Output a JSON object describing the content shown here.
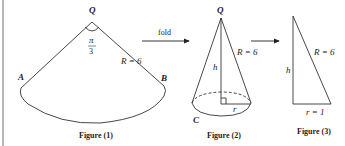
{
  "figures": [
    {
      "caption": "Figure (1)",
      "shape": "sector",
      "labels": {
        "vertex": "Q",
        "angle_num": "π",
        "angle_den": "3",
        "radius": "R = 6",
        "left_point": "A",
        "right_point": "B"
      }
    },
    {
      "caption": "Figure (2)",
      "shape": "cone",
      "labels": {
        "apex": "Q",
        "height": "h",
        "slant": "R = 6",
        "base_radius": "r",
        "base_point": "C"
      }
    },
    {
      "caption": "Figure (3)",
      "shape": "right-triangle",
      "labels": {
        "height": "h",
        "hypotenuse": "R = 6",
        "base": "r = 1"
      }
    }
  ],
  "arrows": [
    {
      "label": "fold"
    },
    {
      "label": ""
    }
  ]
}
